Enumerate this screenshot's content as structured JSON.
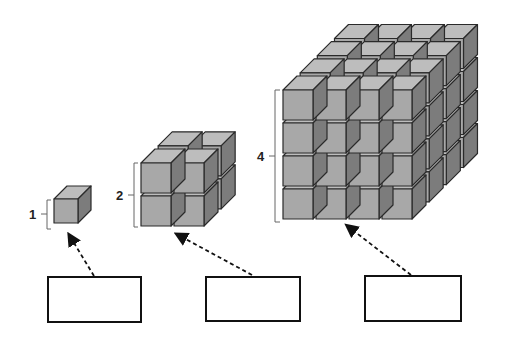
{
  "figure": {
    "colors": {
      "front_face": "#a8a8a8",
      "top_face": "#bdbdbd",
      "side_face": "#7c7c7c",
      "outline": "#2a2a2a",
      "bracket": "#666666"
    },
    "cubes": [
      {
        "id": "cube-1",
        "side_label": "1",
        "n": 1
      },
      {
        "id": "cube-2",
        "side_label": "2",
        "n": 2
      },
      {
        "id": "cube-4",
        "side_label": "4",
        "n": 4
      }
    ],
    "answer_boxes": [
      {
        "id": "box-1",
        "value": ""
      },
      {
        "id": "box-2",
        "value": ""
      },
      {
        "id": "box-3",
        "value": ""
      }
    ]
  }
}
